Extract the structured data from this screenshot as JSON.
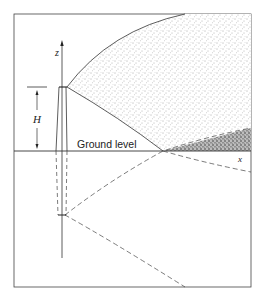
{
  "diagram": {
    "type": "plume-image-source",
    "labels": {
      "z_axis": "z",
      "x_axis": "x",
      "height": "H",
      "ground": "Ground level"
    },
    "colors": {
      "line": "#333333",
      "stipple_light": "#555555",
      "stipple_dark": "#222222",
      "background": "#ffffff"
    }
  }
}
